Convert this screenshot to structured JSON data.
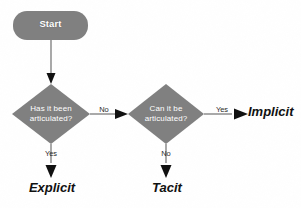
{
  "diagram": {
    "background_color": "#fdfdfd",
    "node_fill_color": "#808080",
    "node_text_color": "#ffffff",
    "line_color": "#6f6f6f",
    "arrow_color": "#111111",
    "terminal_text_color": "#111111"
  },
  "nodes": {
    "start": {
      "label": "Start",
      "shape": "rounded-rectangle"
    },
    "decision_1": {
      "label": "Has it been\narticulated?",
      "shape": "diamond"
    },
    "decision_2": {
      "label": "Can it be\narticulated?",
      "shape": "diamond"
    }
  },
  "edges": {
    "start_to_decision_1": {
      "label": ""
    },
    "decision_1_no": {
      "label": "No"
    },
    "decision_1_yes": {
      "label": "Yes"
    },
    "decision_2_yes": {
      "label": "Yes"
    },
    "decision_2_no": {
      "label": "No"
    }
  },
  "terminals": {
    "explicit": {
      "label": "Explicit"
    },
    "tacit": {
      "label": "Tacit"
    },
    "implicit": {
      "label": "Implicit"
    }
  }
}
